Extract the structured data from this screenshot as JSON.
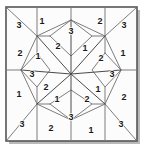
{
  "figure": {
    "colors": {
      "background": "#ffffff",
      "panel": "#fcfcfc",
      "frame": "#555555",
      "line": "#7d7d7d",
      "line_dark": "#3c3c3c",
      "digit": "#1a1a1a",
      "shadow": "#b9b9b9"
    },
    "frame": {
      "x": 6,
      "y": 7,
      "width": 131,
      "height": 134
    },
    "shadow_offset": 3
  },
  "labels": [
    {
      "id": "corner-tl-outer",
      "value": "3",
      "x": 19,
      "y": 25
    },
    {
      "id": "top-left-peak",
      "value": "1",
      "x": 42,
      "y": 21
    },
    {
      "id": "top-diamond",
      "value": "3",
      "x": 71,
      "y": 31
    },
    {
      "id": "top-right-peak",
      "value": "2",
      "x": 100,
      "y": 21
    },
    {
      "id": "corner-tr-outer",
      "value": "3",
      "x": 124,
      "y": 25
    },
    {
      "id": "upper-left-inner",
      "value": "2",
      "x": 58,
      "y": 46
    },
    {
      "id": "upper-right-inner",
      "value": "1",
      "x": 85,
      "y": 48
    },
    {
      "id": "left-upper-wedge",
      "value": "1",
      "x": 38,
      "y": 56
    },
    {
      "id": "right-upper-wedge",
      "value": "2",
      "x": 101,
      "y": 58
    },
    {
      "id": "edge-left-upper",
      "value": "2",
      "x": 20,
      "y": 53
    },
    {
      "id": "edge-right-upper",
      "value": "1",
      "x": 123,
      "y": 53
    },
    {
      "id": "left-diamond",
      "value": "3",
      "x": 32,
      "y": 74
    },
    {
      "id": "right-diamond",
      "value": "3",
      "x": 112,
      "y": 74
    },
    {
      "id": "lower-left-inner",
      "value": "2",
      "x": 46,
      "y": 87
    },
    {
      "id": "lower-right-inner",
      "value": "1",
      "x": 98,
      "y": 89
    },
    {
      "id": "left-lower-wedge",
      "value": "1",
      "x": 57,
      "y": 99
    },
    {
      "id": "right-lower-wedge",
      "value": "2",
      "x": 87,
      "y": 99
    },
    {
      "id": "edge-left-lower",
      "value": "1",
      "x": 19,
      "y": 94
    },
    {
      "id": "edge-right-lower",
      "value": "2",
      "x": 124,
      "y": 97
    },
    {
      "id": "corner-bl-outer",
      "value": "3",
      "x": 22,
      "y": 124
    },
    {
      "id": "bottom-left-peak",
      "value": "2",
      "x": 51,
      "y": 128
    },
    {
      "id": "bottom-diamond",
      "value": "3",
      "x": 71,
      "y": 117
    },
    {
      "id": "bottom-right-peak",
      "value": "1",
      "x": 91,
      "y": 130
    },
    {
      "id": "corner-br-outer",
      "value": "3",
      "x": 121,
      "y": 124
    }
  ],
  "geometry": {
    "polylines": [
      {
        "id": "octagon-ring",
        "points": "37,36 71,20 105,36 121,70 105,104 71,120 37,104 21,70 37,36"
      },
      {
        "id": "diag-tl",
        "points": "7,8 37,36"
      },
      {
        "id": "diag-tr",
        "points": "136,8 105,36"
      },
      {
        "id": "diag-bl",
        "points": "7,140 37,104"
      },
      {
        "id": "diag-br",
        "points": "136,140 105,104"
      },
      {
        "id": "edge-top-left-v",
        "points": "37,36 37,8"
      },
      {
        "id": "edge-top-right-v",
        "points": "105,36 105,8"
      },
      {
        "id": "edge-bot-left-v",
        "points": "37,104 37,140"
      },
      {
        "id": "edge-bot-right-v",
        "points": "105,104 105,140"
      },
      {
        "id": "edge-left-top-h",
        "points": "21,70 7,70"
      },
      {
        "id": "edge-right-top-h",
        "points": "121,70 136,70"
      },
      {
        "id": "spoke-n",
        "points": "71,74 71,20"
      },
      {
        "id": "spoke-s",
        "points": "71,74 71,120"
      },
      {
        "id": "spoke-w",
        "points": "71,74 21,70"
      },
      {
        "id": "spoke-e",
        "points": "71,74 121,70"
      },
      {
        "id": "spoke-nw",
        "points": "71,74 37,36"
      },
      {
        "id": "spoke-ne",
        "points": "71,74 105,36"
      },
      {
        "id": "spoke-sw",
        "points": "71,74 37,104"
      },
      {
        "id": "spoke-se",
        "points": "71,74 105,104"
      },
      {
        "id": "inner-diamond-top",
        "points": "50,36 71,56 92,36"
      },
      {
        "id": "inner-diamond-bottom",
        "points": "50,104 71,90 92,104"
      },
      {
        "id": "inner-diamond-left",
        "points": "37,53 50,70 37,87"
      },
      {
        "id": "inner-diamond-right",
        "points": "105,53 92,70 105,87"
      },
      {
        "id": "chord-nw",
        "points": "37,36 50,36"
      },
      {
        "id": "chord-wn",
        "points": "37,36 37,53"
      },
      {
        "id": "chord-ne",
        "points": "105,36 92,36"
      },
      {
        "id": "chord-en",
        "points": "105,36 105,53"
      },
      {
        "id": "chord-sw",
        "points": "37,104 50,104"
      },
      {
        "id": "chord-ws",
        "points": "37,104 37,87"
      },
      {
        "id": "chord-se",
        "points": "105,104 92,104"
      },
      {
        "id": "chord-es",
        "points": "105,104 105,87"
      },
      {
        "id": "tl-diamond",
        "points": "37,36 21,70 37,53"
      },
      {
        "id": "tr-diamond",
        "points": "105,36 121,70 105,53"
      },
      {
        "id": "bl-diamond",
        "points": "37,104 21,70 37,87"
      },
      {
        "id": "br-diamond",
        "points": "105,104 121,70 105,87"
      },
      {
        "id": "mid-left-diamond",
        "points": "37,53 50,70 37,87 21,70 37,53"
      },
      {
        "id": "mid-right-diamond",
        "points": "105,53 92,70 105,87 121,70 105,53"
      },
      {
        "id": "mid-top-diamond",
        "points": "50,36 71,20 92,36 71,56 50,36"
      },
      {
        "id": "mid-bot-diamond",
        "points": "50,104 71,120 92,104 71,90 50,104"
      }
    ]
  }
}
